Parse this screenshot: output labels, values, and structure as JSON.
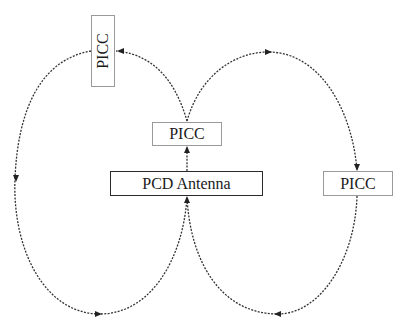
{
  "diagram": {
    "nodes": [
      {
        "id": "picc_top",
        "label": "PICC",
        "orientation": "vertical"
      },
      {
        "id": "picc_middle",
        "label": "PICC",
        "orientation": "horizontal"
      },
      {
        "id": "pcd_antenna",
        "label": "PCD Antenna",
        "orientation": "horizontal"
      },
      {
        "id": "picc_right",
        "label": "PICC",
        "orientation": "horizontal"
      }
    ],
    "edges": [
      {
        "from": "pcd_antenna",
        "to": "picc_middle",
        "style": "dotted",
        "arrow": "up"
      },
      {
        "from": "picc_middle",
        "to": "picc_top",
        "style": "dotted-curve",
        "arrow": "left"
      },
      {
        "from": "picc_top",
        "to": "pcd_antenna",
        "style": "dotted-curve",
        "path": "left loop",
        "arrows": [
          "down",
          "right",
          "up"
        ]
      },
      {
        "from": "picc_middle",
        "to": "picc_right",
        "style": "dotted-curve",
        "path": "right arc",
        "arrows": [
          "right",
          "down"
        ]
      },
      {
        "from": "picc_right",
        "to": "pcd_antenna",
        "style": "dotted-curve",
        "path": "right loop bottom",
        "arrows": [
          "left",
          "up"
        ]
      }
    ],
    "colors": {
      "line": "#333333",
      "box_border_thin": "#9a9a9a",
      "box_border_thick": "#2a2a2a"
    }
  }
}
